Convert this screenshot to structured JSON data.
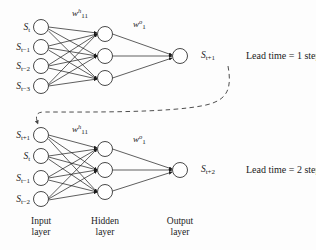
{
  "figure": {
    "background_color": "#fdfdfd",
    "stroke_color": "#1a1a1a",
    "node_fill": "#ffffff"
  },
  "networks": [
    {
      "id": "network-top",
      "inputs": [
        {
          "base": "S",
          "sub": "t"
        },
        {
          "base": "S",
          "sub": "t−1"
        },
        {
          "base": "S",
          "sub": "t−2"
        },
        {
          "base": "S",
          "sub": "t−3"
        }
      ],
      "hidden_count": 3,
      "output": {
        "base": "S",
        "sub": "t+1"
      },
      "hidden_weight": {
        "base": "w",
        "sup": "h",
        "sub": "11"
      },
      "output_weight": {
        "base": "w",
        "sup": "o",
        "sub": "1"
      },
      "lead_time": "Lead time = 1 step"
    },
    {
      "id": "network-bottom",
      "inputs": [
        {
          "base": "S",
          "sub": "t+1"
        },
        {
          "base": "S",
          "sub": "t"
        },
        {
          "base": "S",
          "sub": "t−1"
        },
        {
          "base": "S",
          "sub": "t−2"
        }
      ],
      "hidden_count": 3,
      "output": {
        "base": "S",
        "sub": "t+2"
      },
      "hidden_weight": {
        "base": "w",
        "sup": "h",
        "sub": "11"
      },
      "output_weight": {
        "base": "w",
        "sup": "o",
        "sub": "1"
      },
      "lead_time": "Lead time = 2 step"
    }
  ],
  "layer_labels": [
    {
      "line1": "Input",
      "line2": "layer"
    },
    {
      "line1": "Hidden",
      "line2": "layer"
    },
    {
      "line1": "Output",
      "line2": "layer"
    }
  ],
  "feedback": {
    "name": "feedback-connection",
    "style": "dashed",
    "description": "Output S(t+1) of first network feeds into input of second network"
  }
}
